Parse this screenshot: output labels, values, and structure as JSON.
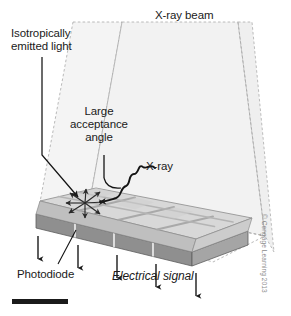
{
  "labels": {
    "isotropic": "Isotropically\nemitted light",
    "xray_beam": "X-ray beam",
    "acceptance_angle": "Large\nacceptance\nangle",
    "xray": "X-ray",
    "photodiode": "Photodiode",
    "electrical_signal": "Electrical signal",
    "credit": "© Cengage Learning 2013"
  },
  "colors": {
    "ink": "#1a1a1a",
    "beam_fill": "#f0f0f0",
    "beam_edge": "#9a9a9a",
    "scintillator_top": "#d6d6d6",
    "scintillator_side": "#bdbdbd",
    "photodiode_top": "#c2c2c2",
    "photodiode_front": "#8f8f8f",
    "septa": "#a8a8a8",
    "credit_text": "#8a8a8a",
    "scale_bar": "#1a1a1a"
  },
  "geometry": {
    "detector_columns": 4,
    "detector_rows": 3,
    "signal_arrows": 5,
    "burst_rays": 8,
    "beam_style": "dashed-outline translucent volume"
  }
}
